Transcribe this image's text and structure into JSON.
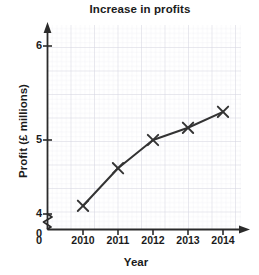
{
  "chart_data": {
    "type": "line",
    "title": "Increase in profits",
    "xlabel": "Year",
    "ylabel": "Profit (£ millions)",
    "categories": [
      "2010",
      "2011",
      "2012",
      "2013",
      "2014"
    ],
    "x": [
      2010,
      2011,
      2012,
      2013,
      2014
    ],
    "values": [
      4.3,
      4.7,
      5.0,
      5.13,
      5.3
    ],
    "series": [
      {
        "name": "Profit",
        "values": [
          4.3,
          4.7,
          5.0,
          5.13,
          5.3
        ],
        "marker": "cross",
        "color": "#333333"
      }
    ],
    "ylim": [
      4.0,
      6.1
    ],
    "xlim": [
      2009.6,
      2014.5
    ],
    "y_ticks": [
      "4",
      "5",
      "6"
    ],
    "y_tick_values": [
      4,
      5,
      6
    ],
    "x_ticks": [
      "2010",
      "2011",
      "2012",
      "2013",
      "2014"
    ],
    "origin_label": "0",
    "axis_break": true,
    "axis_break_note": "zigzag break on y-axis between 0 and 4",
    "grid": true,
    "grid_minor": true,
    "legend": null,
    "legend_position": "none",
    "grid_color": "#d9d9e2",
    "grid_minor_color": "#ececf2",
    "axis_color": "#2b2b2b",
    "line_color": "#333333",
    "background": "#ffffff"
  },
  "axis": {
    "y_tick_6": "6",
    "y_tick_5": "5",
    "y_tick_4": "4",
    "origin": "0",
    "x_tick_2010": "2010",
    "x_tick_2011": "2011",
    "x_tick_2012": "2012",
    "x_tick_2013": "2013",
    "x_tick_2014": "2014"
  }
}
